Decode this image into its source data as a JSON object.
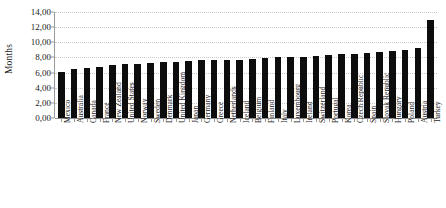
{
  "chart_data": {
    "type": "bar",
    "title": "",
    "subtitle": "",
    "xlabel": "",
    "ylabel": "Months",
    "ylim": [
      0,
      14
    ],
    "ytick_labels": [
      "0,00",
      "2,00",
      "4,00",
      "6,00",
      "8,00",
      "10,00",
      "12,00",
      "14,00"
    ],
    "ytick_values": [
      0,
      2,
      4,
      6,
      8,
      10,
      12,
      14
    ],
    "grid": true,
    "legend": null,
    "bar_color": "#0d0d0d",
    "grid_color": "#c8c8c8",
    "axis_color": "#9a9a9a",
    "categories": [
      "Mexico",
      "Australia",
      "Canada",
      "France",
      "New Zealand",
      "United States",
      "Norway",
      "Sweden",
      "Denmark",
      "United Kingdom",
      "Japan",
      "Germany",
      "Greece",
      "Netherlands",
      "Iceland",
      "Belgium",
      "Finland",
      "Italy",
      "Luxembourg",
      "Ireland",
      "Switzerland",
      "Portugal",
      "Korea",
      "Czech Republic",
      "Spain",
      "Slovak Republic",
      "Hungary",
      "Poland",
      "Austria",
      "Turkey"
    ],
    "values": [
      6.1,
      6.5,
      6.6,
      6.8,
      7.0,
      7.1,
      7.2,
      7.3,
      7.4,
      7.4,
      7.5,
      7.6,
      7.6,
      7.7,
      7.7,
      7.8,
      7.9,
      8.0,
      8.0,
      8.1,
      8.2,
      8.3,
      8.4,
      8.5,
      8.6,
      8.7,
      8.9,
      9.0,
      9.2,
      12.9
    ]
  }
}
